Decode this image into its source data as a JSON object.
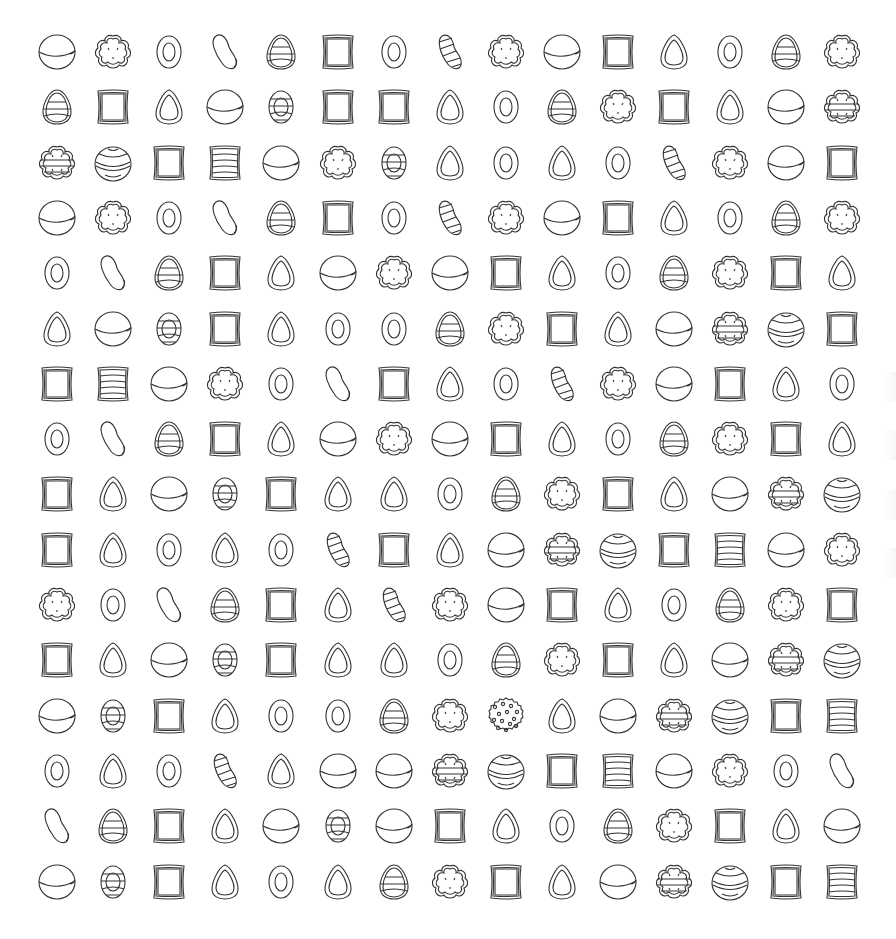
{
  "board": {
    "rows": 16,
    "cols": 15,
    "origin_x": 57,
    "origin_y": 52,
    "col_step": 56.1,
    "row_step": 55.3,
    "stroke_color": "#333333",
    "background": "#ffffff",
    "grid": [
      [
        "ball",
        "flower",
        "ring",
        "bean",
        "egg",
        "square",
        "ring",
        "bean-striped",
        "flower",
        "ball",
        "square",
        "teardrop",
        "ring",
        "egg",
        "flower"
      ],
      [
        "egg",
        "square",
        "teardrop",
        "ball",
        "oval-striped",
        "square",
        "square",
        "teardrop",
        "ring",
        "egg",
        "flower",
        "square",
        "teardrop",
        "ball",
        "cookie"
      ],
      [
        "cookie",
        "ball-striped",
        "square",
        "square-striped",
        "ball",
        "flower",
        "oval-striped",
        "teardrop",
        "ring",
        "teardrop",
        "ring",
        "bean-striped",
        "flower",
        "ball",
        "square"
      ],
      [
        "ball",
        "flower",
        "ring",
        "bean",
        "egg",
        "square",
        "ring",
        "bean-striped",
        "flower",
        "ball",
        "square",
        "teardrop",
        "ring",
        "egg",
        "flower"
      ],
      [
        "ring",
        "bean",
        "egg",
        "square",
        "teardrop",
        "ball",
        "flower",
        "ball",
        "square",
        "teardrop",
        "ring",
        "egg",
        "flower",
        "square",
        "teardrop"
      ],
      [
        "teardrop",
        "ball",
        "oval-striped",
        "square",
        "teardrop",
        "ring",
        "ring",
        "egg",
        "flower",
        "square",
        "teardrop",
        "ball",
        "cookie",
        "ball-striped",
        "square"
      ],
      [
        "square",
        "square-striped",
        "ball",
        "flower",
        "ring",
        "bean",
        "square",
        "teardrop",
        "ring",
        "bean-striped",
        "flower",
        "ball",
        "square",
        "teardrop",
        "ring"
      ],
      [
        "ring",
        "bean",
        "egg",
        "square",
        "teardrop",
        "ball",
        "flower",
        "ball",
        "square",
        "teardrop",
        "ring",
        "egg",
        "flower",
        "square",
        "teardrop"
      ],
      [
        "square",
        "teardrop",
        "ball",
        "oval-striped",
        "square",
        "teardrop",
        "teardrop",
        "ring",
        "egg",
        "flower",
        "square",
        "teardrop",
        "ball",
        "cookie",
        "ball-striped"
      ],
      [
        "square",
        "teardrop",
        "ring",
        "teardrop",
        "ring",
        "bean-striped",
        "square",
        "teardrop",
        "ball",
        "cookie",
        "ball-striped",
        "square",
        "square-striped",
        "ball",
        "flower"
      ],
      [
        "flower",
        "ring",
        "bean",
        "egg",
        "square",
        "teardrop",
        "bean-striped",
        "flower",
        "ball",
        "square",
        "teardrop",
        "ring",
        "egg",
        "flower",
        "square"
      ],
      [
        "square",
        "teardrop",
        "ball",
        "oval-striped",
        "square",
        "teardrop",
        "teardrop",
        "ring",
        "egg",
        "flower",
        "square",
        "teardrop",
        "ball",
        "cookie",
        "ball-striped"
      ],
      [
        "ball",
        "oval-striped",
        "square",
        "teardrop",
        "ring",
        "ring",
        "egg",
        "flower",
        "sprinkle-ball",
        "teardrop",
        "ball",
        "cookie",
        "ball-striped",
        "square",
        "square-striped"
      ],
      [
        "ring",
        "teardrop",
        "ring",
        "bean-striped",
        "teardrop",
        "ball",
        "ball",
        "cookie",
        "ball-striped",
        "square",
        "square-striped",
        "ball",
        "flower",
        "ring",
        "bean"
      ],
      [
        "bean",
        "egg",
        "square",
        "teardrop",
        "ball",
        "oval-striped",
        "ball",
        "square",
        "teardrop",
        "ring",
        "egg",
        "flower",
        "square",
        "teardrop",
        "ball"
      ],
      [
        "ball",
        "oval-striped",
        "square",
        "teardrop",
        "ring",
        "teardrop",
        "egg",
        "flower",
        "square",
        "teardrop",
        "ball",
        "cookie",
        "ball-striped",
        "square",
        "square-striped"
      ]
    ]
  },
  "edge_ghosts_y": [
    372,
    430,
    490,
    548
  ]
}
